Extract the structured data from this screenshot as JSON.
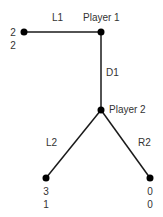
{
  "diagram": {
    "type": "extensive-form game tree",
    "colors": {
      "line": "#1a1a1a",
      "node": "#000000",
      "text": "#333333"
    },
    "nodes": [
      {
        "id": "p1",
        "label": "Player 1",
        "x": 101,
        "y": 32
      },
      {
        "id": "p2",
        "label": "Player 2",
        "x": 101,
        "y": 110
      },
      {
        "id": "t1",
        "payoffs": [
          "2",
          "2"
        ],
        "x": 24,
        "y": 32
      },
      {
        "id": "t2",
        "payoffs": [
          "3",
          "1"
        ],
        "x": 46,
        "y": 178
      },
      {
        "id": "t3",
        "payoffs": [
          "0",
          "0"
        ],
        "x": 150,
        "y": 178
      }
    ],
    "edges": [
      {
        "from": "p1",
        "to": "t1",
        "label": "L1"
      },
      {
        "from": "p1",
        "to": "p2",
        "label": "D1"
      },
      {
        "from": "p2",
        "to": "t2",
        "label": "L2"
      },
      {
        "from": "p2",
        "to": "t3",
        "label": "R2"
      }
    ]
  }
}
